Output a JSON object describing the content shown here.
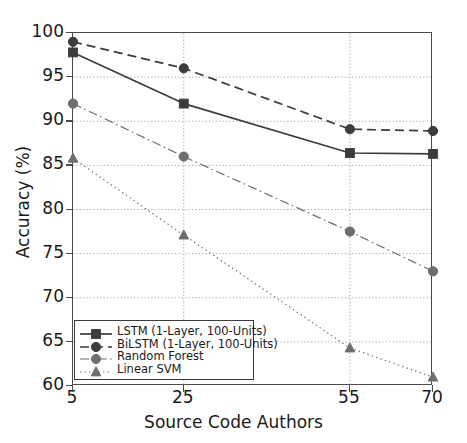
{
  "chart_data": {
    "type": "line",
    "title": "",
    "xlabel": "Source Code Authors",
    "ylabel": "Accuracy (%)",
    "x": [
      5,
      25,
      55,
      70
    ],
    "xticks": [
      "5",
      "25",
      "55",
      "70"
    ],
    "yticks": [
      "60",
      "65",
      "70",
      "75",
      "80",
      "85",
      "90",
      "95",
      "100"
    ],
    "xlim": [
      5,
      70
    ],
    "ylim": [
      60,
      100
    ],
    "grid": true,
    "grid_style": "dotted",
    "legend_position": "lower left",
    "series": [
      {
        "name": "LSTM (1-Layer, 100-Units)",
        "values": [
          97.8,
          92.0,
          86.4,
          86.3
        ],
        "linestyle": "solid",
        "marker": "square",
        "color": "#3c3c3c"
      },
      {
        "name": "BiLSTM (1-Layer, 100-Units)",
        "values": [
          99.0,
          96.0,
          89.1,
          88.9
        ],
        "linestyle": "dashed",
        "marker": "circle",
        "color": "#3c3c3c"
      },
      {
        "name": "Random Forest",
        "values": [
          92.0,
          86.0,
          77.5,
          73.0
        ],
        "linestyle": "dashdot",
        "marker": "circle",
        "color": "#6e6e6e"
      },
      {
        "name": "Linear SVM",
        "values": [
          85.8,
          77.1,
          64.3,
          61.0
        ],
        "linestyle": "dotted",
        "marker": "triangle",
        "color": "#6e6e6e"
      }
    ]
  },
  "axes": {
    "frame_color": "#4a4a4a",
    "background": "#ffffff"
  }
}
